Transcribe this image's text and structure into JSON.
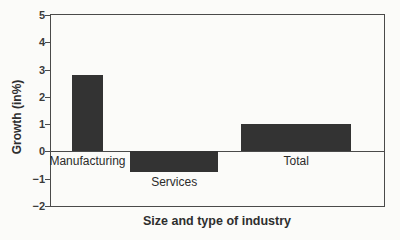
{
  "figure": {
    "background": "#fbfbf9",
    "ink_color": "#4a4a4a",
    "bar_color": "#333333"
  },
  "chart_data": {
    "type": "bar",
    "title": "",
    "xlabel": "Size and type of industry",
    "ylabel": "Growth (in%)",
    "ylim": [
      -2,
      5
    ],
    "yticks": [
      5,
      4,
      3,
      2,
      1,
      0,
      -1,
      -2
    ],
    "grid": false,
    "legend": "none",
    "variable_bar_widths": true,
    "categories": [
      "Manufacturing",
      "Services",
      "Total"
    ],
    "values": [
      2.8,
      -0.75,
      1.0
    ],
    "bars": [
      {
        "label": "Manufacturing",
        "value": 2.8,
        "left_frac": 0.063,
        "width_frac": 0.093
      },
      {
        "label": "Services",
        "value": -0.75,
        "left_frac": 0.237,
        "width_frac": 0.266
      },
      {
        "label": "Total",
        "value": 1.0,
        "left_frac": 0.572,
        "width_frac": 0.329
      }
    ]
  }
}
